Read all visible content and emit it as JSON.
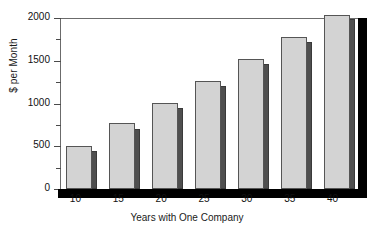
{
  "chart_data": {
    "type": "bar",
    "title": "",
    "xlabel": "Years with One Company",
    "ylabel": "$ per Month",
    "categories": [
      "10",
      "15",
      "20",
      "25",
      "30",
      "35",
      "40"
    ],
    "series": [
      {
        "name": "front",
        "values": [
          500,
          775,
          1010,
          1265,
          1525,
          1780,
          2035
        ]
      },
      {
        "name": "shadow",
        "values": [
          440,
          700,
          950,
          1205,
          1460,
          1720,
          1985
        ]
      }
    ],
    "ylim": [
      0,
      2000
    ],
    "ytick_labels": [
      "0",
      "500",
      "1000",
      "1500",
      "2000"
    ],
    "ytick_values": [
      0,
      500,
      1000,
      1500,
      2000
    ],
    "yminor_values": [
      250,
      750,
      1250,
      1750
    ],
    "grid": false,
    "legend": "none",
    "colors": {
      "bar_front": "#d3d3d3",
      "bar_front_edge": "#555555",
      "bar_shadow": "#4f4f4f",
      "frame": "#6b6b6b",
      "axis_black": "#000000",
      "background": "#ffffff",
      "text": "#111111"
    }
  }
}
